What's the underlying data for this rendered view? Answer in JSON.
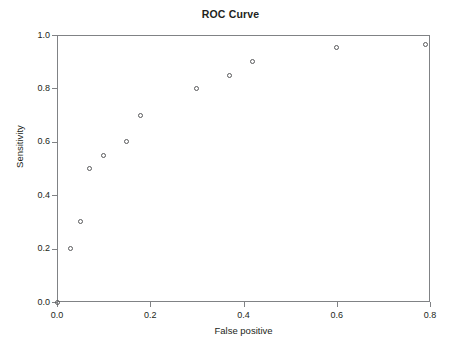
{
  "chart_data": {
    "type": "scatter",
    "title": "ROC Curve",
    "xlabel": "False positive",
    "ylabel": "Sensitivity",
    "xlim": [
      0.0,
      0.8
    ],
    "ylim": [
      0.0,
      1.0
    ],
    "grid": false,
    "legend": false,
    "legend_position": "none",
    "marker_style": "open-circle",
    "marker_color": "#58595b",
    "frame_color": "#808285",
    "background_color": "#ffffff",
    "xticks": [
      "0.0",
      "0.2",
      "0.4",
      "0.6",
      "0.8"
    ],
    "xtick_values": [
      0.0,
      0.2,
      0.4,
      0.6,
      0.8
    ],
    "yticks": [
      "0.0",
      "0.2",
      "0.4",
      "0.6",
      "0.8",
      "1.0"
    ],
    "ytick_values": [
      0.0,
      0.2,
      0.4,
      0.6,
      0.8,
      1.0
    ],
    "x": [
      0.0,
      0.03,
      0.05,
      0.07,
      0.1,
      0.15,
      0.18,
      0.3,
      0.37,
      0.42,
      0.6,
      0.79
    ],
    "y": [
      0.0,
      0.2,
      0.3,
      0.5,
      0.55,
      0.6,
      0.7,
      0.8,
      0.85,
      0.9,
      0.955,
      0.965
    ],
    "points": [
      {
        "x": 0.0,
        "y": 0.0
      },
      {
        "x": 0.03,
        "y": 0.2
      },
      {
        "x": 0.05,
        "y": 0.3
      },
      {
        "x": 0.07,
        "y": 0.5
      },
      {
        "x": 0.1,
        "y": 0.55
      },
      {
        "x": 0.15,
        "y": 0.6
      },
      {
        "x": 0.18,
        "y": 0.7
      },
      {
        "x": 0.3,
        "y": 0.8
      },
      {
        "x": 0.37,
        "y": 0.85
      },
      {
        "x": 0.42,
        "y": 0.9
      },
      {
        "x": 0.6,
        "y": 0.955
      },
      {
        "x": 0.79,
        "y": 0.965
      }
    ]
  }
}
